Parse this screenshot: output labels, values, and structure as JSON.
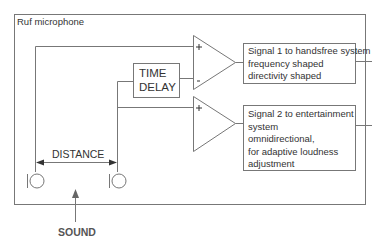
{
  "diagram": {
    "container_label": "Ruf microphone",
    "time_delay": {
      "line1": "TIME",
      "line2": "DELAY"
    },
    "amplifier1": {
      "plus": "+",
      "minus": "-"
    },
    "amplifier2": {
      "plus": "+"
    },
    "signal1": {
      "lines": [
        "Signal 1 to handsfree system",
        "frequency shaped",
        "directivity shaped"
      ]
    },
    "signal2": {
      "lines": [
        "Signal 2 to entertainment",
        "system",
        "omnidirectional,",
        "for adaptive loudness",
        "adjustment"
      ]
    },
    "distance_label": "DISTANCE",
    "sound_label": "SOUND",
    "colors": {
      "line": "#777777",
      "text": "#333333",
      "background": "#ffffff"
    }
  }
}
